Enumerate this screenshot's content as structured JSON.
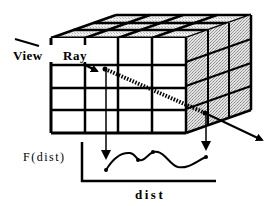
{
  "diagram": {
    "labels": {
      "view": "View",
      "ray": "Ray",
      "f_of_dist": "F(dist)",
      "dist": "dist"
    },
    "volume": {
      "front_columns": 4,
      "front_rows": 4,
      "depth_slices": 3,
      "right_face_fill": "stippled-gray",
      "line_color": "#000000",
      "shade_color": "#c8c8c8"
    },
    "ray": {
      "style": "dashed-hatched",
      "entry_point": "front face, row 2",
      "exit_point": "right face",
      "direction": "left-to-right, descending"
    },
    "projections": [
      {
        "from": "entry sample",
        "to": "graph start point"
      },
      {
        "from": "exit sample",
        "to": "graph end point"
      }
    ],
    "graph": {
      "x_axis_label": "dist",
      "y_axis_label": "F(dist)",
      "curve": "wavy line with sample dots"
    }
  }
}
